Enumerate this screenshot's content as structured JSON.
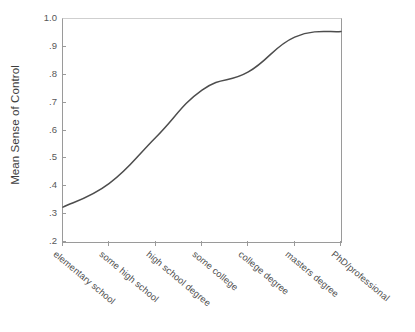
{
  "chart_data": {
    "type": "line",
    "title": "",
    "xlabel": "",
    "ylabel": "Mean Sense of Control",
    "categories": [
      "elementary school",
      "some high school",
      "high school degree",
      "some college",
      "college degree",
      "masters degree",
      "PhD/professional"
    ],
    "values": [
      0.325,
      0.41,
      0.575,
      0.745,
      0.81,
      0.935,
      0.955
    ],
    "ylim": [
      0.2,
      1.0
    ],
    "ytick_labels": [
      "1.0",
      ".9",
      ".8",
      ".7",
      ".6",
      ".5",
      ".4",
      ".3",
      ".2"
    ],
    "ytick_values": [
      1.0,
      0.9,
      0.8,
      0.7,
      0.6,
      0.5,
      0.4,
      0.3,
      0.2
    ],
    "grid": false,
    "legend": "none",
    "line_color": "#4d4d4d",
    "axis_color": "#9a9a9a",
    "background": "#ffffff"
  }
}
